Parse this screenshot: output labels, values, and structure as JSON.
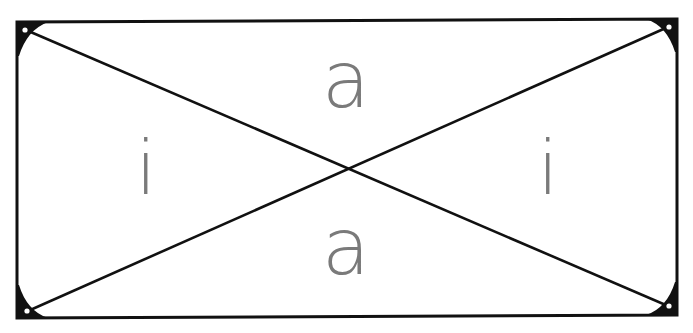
{
  "diagram": {
    "frame": {
      "corners": {
        "top_left": [
          17,
          22
        ],
        "top_right": [
          677,
          19
        ],
        "bottom_right": [
          677,
          315
        ],
        "bottom_left": [
          17,
          318
        ]
      },
      "stroke_color": "#111111",
      "fill_color": "#ffffff"
    },
    "diagonals": [
      {
        "from": [
          28,
          30
        ],
        "to": [
          668,
          306
        ]
      },
      {
        "from": [
          668,
          27
        ],
        "to": [
          28,
          311
        ]
      }
    ],
    "center": [
      348,
      168
    ],
    "letter_color": "#7a7a7a",
    "regions": {
      "top": {
        "label": "a",
        "x": 346,
        "y": 84
      },
      "bottom": {
        "label": "a",
        "x": 346,
        "y": 252
      },
      "left": {
        "label": "i",
        "x": 146,
        "y": 170
      },
      "right": {
        "label": "i",
        "x": 548,
        "y": 170
      }
    }
  }
}
